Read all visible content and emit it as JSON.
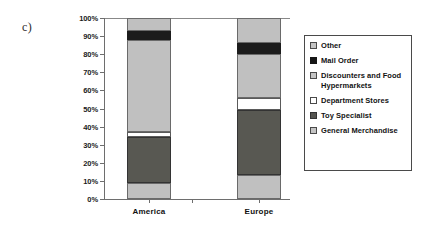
{
  "panel_label": "c)",
  "legend": {
    "position": "right",
    "items": [
      {
        "label": "Other",
        "swatch": "light-gray-swatch",
        "color": "#c4c4c4"
      },
      {
        "label": "Mail Order",
        "swatch": "black-swatch",
        "color": "#161616"
      },
      {
        "label": "Discounters and Food Hypermarkets",
        "swatch": "light-gray-swatch",
        "color": "#c4c4c4"
      },
      {
        "label": "Department Stores",
        "swatch": "white-swatch",
        "color": "#ffffff"
      },
      {
        "label": "Toy Specialist",
        "swatch": "dark-gray-swatch",
        "color": "#555550"
      },
      {
        "label": "General Merchandise",
        "swatch": "light-gray-swatch",
        "color": "#c4c4c4"
      }
    ]
  },
  "axis": {
    "y_ticks": [
      "100%",
      "90%",
      "80%",
      "70%",
      "60%",
      "50%",
      "40%",
      "30%",
      "20%",
      "10%",
      "0%"
    ],
    "y_values": [
      100,
      90,
      80,
      70,
      60,
      50,
      40,
      30,
      20,
      10,
      0
    ],
    "x_categories": [
      "America",
      "Europe"
    ]
  },
  "chart_data": {
    "type": "bar",
    "subtype": "stacked-percentage-column",
    "title": "",
    "xlabel": "",
    "ylabel": "",
    "ylim": [
      0,
      100
    ],
    "yticks": [
      0,
      10,
      20,
      30,
      40,
      50,
      60,
      70,
      80,
      90,
      100
    ],
    "ytick_labels": [
      "0%",
      "10%",
      "20%",
      "30%",
      "40%",
      "50%",
      "60%",
      "70%",
      "80%",
      "90%",
      "100%"
    ],
    "grid": false,
    "legend_position": "right",
    "categories": [
      "America",
      "Europe"
    ],
    "series": [
      {
        "name": "General Merchandise",
        "values": [
          9,
          13
        ],
        "color": "#c0c0c0"
      },
      {
        "name": "Toy Specialist",
        "values": [
          25,
          36
        ],
        "color": "#585852"
      },
      {
        "name": "Department Stores",
        "values": [
          3,
          7
        ],
        "color": "#ffffff"
      },
      {
        "name": "Discounters and Food Hypermarkets",
        "values": [
          51,
          24
        ],
        "color": "#c0c0c0"
      },
      {
        "name": "Mail Order",
        "values": [
          5,
          6
        ],
        "color": "#1c1c1c"
      },
      {
        "name": "Other",
        "values": [
          7,
          14
        ],
        "color": "#c0c0c0"
      }
    ],
    "stack_boundaries": {
      "America": [
        0,
        9,
        34,
        37,
        88,
        93,
        100
      ],
      "Europe": [
        0,
        13,
        49,
        56,
        80,
        86,
        100
      ]
    }
  }
}
